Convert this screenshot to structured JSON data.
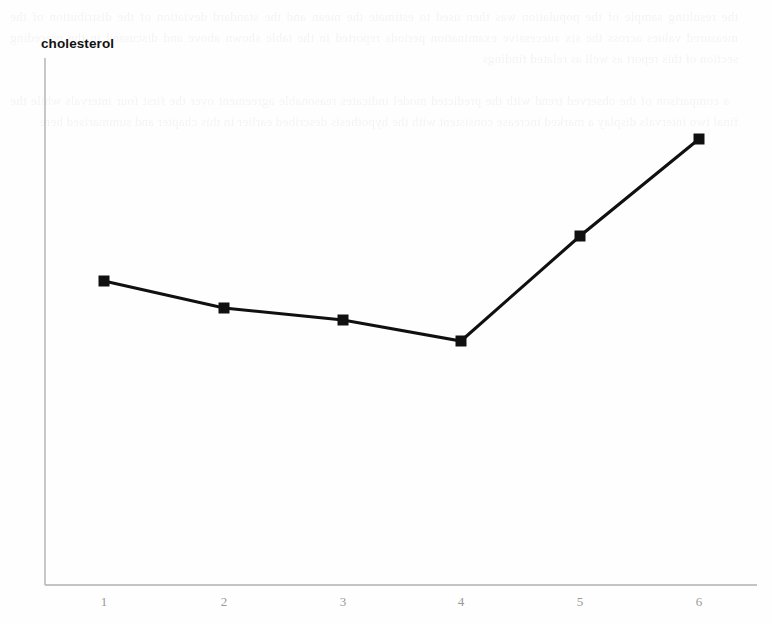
{
  "chart_data": {
    "type": "line",
    "title": "cholesterol",
    "xlabel": "",
    "ylabel": "",
    "categories": [
      "1",
      "2",
      "3",
      "4",
      "5",
      "6"
    ],
    "x": [
      1,
      2,
      3,
      4,
      5,
      6
    ],
    "values": [
      57.6,
      52.6,
      50.3,
      46.3,
      66.2,
      84.6
    ],
    "series": [
      {
        "name": "cholesterol",
        "values": [
          57.6,
          52.6,
          50.3,
          46.3,
          66.2,
          84.6
        ]
      }
    ],
    "xlim": [
      0.5,
      6.5
    ],
    "ylim": [
      0,
      100
    ],
    "grid": false,
    "legend": null,
    "marker": "filled-square",
    "marker_color": "#101010",
    "line_color": "#101010",
    "axis_color": "#b0b0b0",
    "tick_label_color": "#9a9a9a",
    "annotations": []
  },
  "plot": {
    "geometry": {
      "x_axis_y": 585,
      "y_axis_x": 45,
      "y_axis_top": 58,
      "x_axis_right": 757
    },
    "points": [
      {
        "label": "1",
        "px": 104,
        "py": 281
      },
      {
        "label": "2",
        "px": 224,
        "py": 308
      },
      {
        "label": "3",
        "px": 343,
        "py": 320
      },
      {
        "label": "4",
        "px": 461,
        "py": 341
      },
      {
        "label": "5",
        "px": 580,
        "py": 236
      },
      {
        "label": "6",
        "px": 699,
        "py": 139
      }
    ]
  },
  "ghost": {
    "text": "the resulting sample of the population was then used to estimate the mean and the standard deviation of the distribution of the measured values across the six successive examination periods reported in the table shown above and discussed in the preceding section of this report as well as related findings\n\n  a comparison of the observed trend with the predicted model indicates reasonable agreement over the first four intervals while the final two intervals display a marked increase consistent with the hypothesis described earlier in this chapter and summarised here"
  }
}
